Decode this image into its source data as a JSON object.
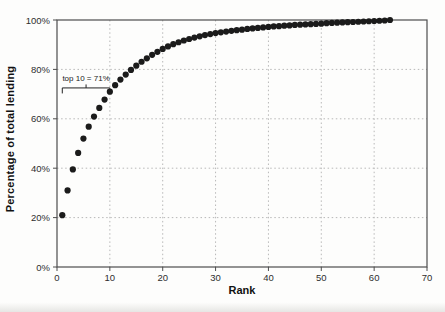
{
  "chart_data": {
    "type": "scatter",
    "title": "",
    "xlabel": "Rank",
    "ylabel": "Percentage of total lending",
    "xlim": [
      0,
      70
    ],
    "ylim": [
      0,
      100
    ],
    "grid": true,
    "legend": "none",
    "x_ticks": [
      0,
      10,
      20,
      30,
      40,
      50,
      60,
      70
    ],
    "y_tick_values": [
      0,
      20,
      40,
      60,
      80,
      100
    ],
    "y_tick_labels": [
      "0%",
      "20%",
      "40%",
      "60%",
      "80%",
      "100%"
    ],
    "annotation": {
      "label": "top 10 = 71%",
      "bracket_from_rank": 1,
      "bracket_to_rank": 10,
      "bracket_y_pct": 72.5
    },
    "series": [
      {
        "name": "cumulative share of total lending by rank",
        "x_is_rank_starting_at": 1,
        "values": [
          21,
          31,
          39.5,
          46.2,
          52,
          56.8,
          60.9,
          64.4,
          67.8,
          71,
          73.6,
          75.9,
          77.9,
          79.8,
          81.5,
          83.1,
          84.5,
          85.9,
          87.1,
          88.3,
          89.3,
          90.2,
          91,
          91.7,
          92.3,
          92.9,
          93.4,
          93.9,
          94.3,
          94.7,
          95,
          95.3,
          95.6,
          95.9,
          96.1,
          96.4,
          96.6,
          96.8,
          97,
          97.2,
          97.4,
          97.5,
          97.7,
          97.8,
          98,
          98.1,
          98.2,
          98.3,
          98.4,
          98.5,
          98.7,
          98.8,
          98.9,
          99,
          99.1,
          99.2,
          99.3,
          99.4,
          99.5,
          99.6,
          99.7,
          99.8,
          100
        ]
      }
    ],
    "colors": {
      "dot": "#1b1b1b",
      "grid": "#b8b8b8",
      "border": "#4d4d4d",
      "tick_text": "#2e2e2e",
      "annotation": "#222222"
    }
  }
}
